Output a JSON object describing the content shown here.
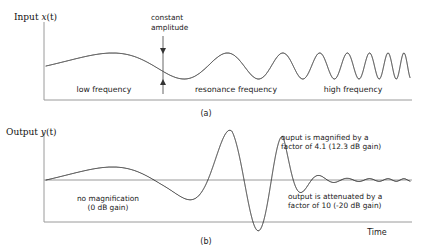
{
  "figure": {
    "caption_a": "(a)",
    "caption_b": "(b)",
    "time_label": "Time"
  },
  "panel_a": {
    "y_axis_label_prefix": "Input ",
    "y_axis_label_var": "x",
    "y_axis_label_arg": "(t)",
    "annotation_amplitude_line1": "constant",
    "annotation_amplitude_line2": "amplitude",
    "region_low": "low frequency",
    "region_resonance": "resonance frequency",
    "region_high": "high frequency"
  },
  "panel_b": {
    "y_axis_label_prefix": "Output ",
    "y_axis_label_var": "y",
    "y_axis_label_arg": "(t)",
    "annotation_nomag_line1": "no magnification",
    "annotation_nomag_line2": "(0 dB gain)",
    "annotation_mag_line1": "ouput is magnified by a",
    "annotation_mag_line2": "factor of 4.1 (12.3 dB gain)",
    "annotation_att_line1": "output is attenuated by a",
    "annotation_att_line2": "factor of 10 (-20 dB gain)"
  },
  "colors": {
    "wave": "#111111",
    "axis": "#9a9a9a",
    "text": "#1a1a1a",
    "background": "#ffffff"
  },
  "chart_data": {
    "type": "line",
    "xlabel": "Time",
    "panels": [
      {
        "id": "a",
        "caption": "(a)",
        "ylabel": "Input x(t)",
        "description": "Constant-amplitude chirp: frequency increases with time while amplitude stays fixed.",
        "plot_box": {
          "x0": 44,
          "y0": 22,
          "x1": 412,
          "y1": 100
        },
        "baseline_y": 66,
        "signal": {
          "amplitude_constant": 1.0,
          "freq_start_hz": 1.0,
          "freq_end_hz": 26.0,
          "freq_sweep": "exponential",
          "x_start": 46,
          "x_end": 410,
          "amplitude_px": 13
        },
        "regions": [
          {
            "label": "low frequency",
            "x_center": 104,
            "x_from": 46,
            "x_to": 160
          },
          {
            "label": "resonance frequency",
            "x_center": 235,
            "x_from": 160,
            "x_to": 297
          },
          {
            "label": "high frequency",
            "x_center": 352,
            "x_from": 297,
            "x_to": 410
          }
        ],
        "annotations": [
          {
            "text": "constant amplitude",
            "lines": [
              "constant",
              "amplitude"
            ],
            "text_x": 151,
            "text_y": 20,
            "arrow_x": 163,
            "arrow_top_y": 38,
            "arrow_bottom_y": 92,
            "measures": "peak-to-peak amplitude of the input"
          }
        ]
      },
      {
        "id": "b",
        "caption": "(b)",
        "ylabel": "Output y(t)",
        "description": "Response of the resonant system: unity gain at low frequency, 4.1x magnification at resonance, 0.1x attenuation at high frequency.",
        "plot_box": {
          "x0": 44,
          "y0": 132,
          "x1": 412,
          "y1": 222
        },
        "baseline_y": 180,
        "signal": {
          "freq_start_hz": 1.0,
          "freq_end_hz": 26.0,
          "freq_sweep": "exponential",
          "x_start": 46,
          "x_end": 410,
          "base_amplitude_px": 13
        },
        "gain_profile": {
          "low_frequency": {
            "linear": 1.0,
            "db": 0.0
          },
          "resonance": {
            "linear": 4.1,
            "db": 12.3
          },
          "high_frequency": {
            "linear": 0.1,
            "db": -20.0
          }
        },
        "resonance_peak": {
          "x_center": 232,
          "x_from": 163,
          "x_to": 283,
          "amplitude_px": 53
        },
        "annotations": [
          {
            "lines": [
              "no magnification",
              "(0 dB gain)"
            ],
            "text_x": 108,
            "text_y": 200,
            "anchor": "middle",
            "refers_to": "low frequency region"
          },
          {
            "lines": [
              "ouput is magnified by a",
              "factor of 4.1 (12.3 dB gain)"
            ],
            "text_x": 281,
            "text_y": 137,
            "anchor": "start",
            "refers_to": "resonance region"
          },
          {
            "lines": [
              "output is attenuated by a",
              "factor of 10 (-20 dB gain)"
            ],
            "text_x": 288,
            "text_y": 196,
            "anchor": "start",
            "refers_to": "high frequency region"
          }
        ]
      }
    ]
  }
}
